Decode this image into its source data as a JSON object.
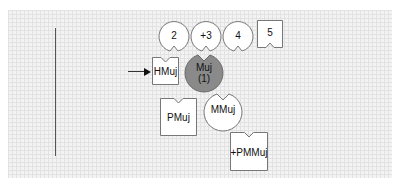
{
  "pieces": [
    {
      "id": "p2",
      "label": "2",
      "shape": "circle-notch-bottom",
      "fill": "#ffffff"
    },
    {
      "id": "p3",
      "label": "+3",
      "shape": "circle-notch-bottom",
      "fill": "#ffffff"
    },
    {
      "id": "p4",
      "label": "4",
      "shape": "circle-notch-bottom",
      "fill": "#ffffff"
    },
    {
      "id": "p5",
      "label": "5",
      "shape": "square-notch-bottom",
      "fill": "#ffffff"
    },
    {
      "id": "hmuj",
      "label": "HMuj",
      "shape": "square-notch-top",
      "fill": "#ffffff"
    },
    {
      "id": "muj",
      "label": "Muj",
      "sublabel": "(1)",
      "shape": "circle-notch-top",
      "fill": "#8a8a8a"
    },
    {
      "id": "pmuj",
      "label": "PMuj",
      "shape": "square-notch-top",
      "fill": "#ffffff"
    },
    {
      "id": "mmuj",
      "label": "MMuj",
      "shape": "circle-notch-top",
      "fill": "#ffffff"
    },
    {
      "id": "pmmuj",
      "label": "+PMMuj",
      "shape": "square-notch-top",
      "fill": "#ffffff"
    }
  ],
  "colors": {
    "grid_bg": "#f3f3f3",
    "grid_line": "#e2e2e2",
    "outline": "#777777",
    "highlight": "#8a8a8a"
  }
}
